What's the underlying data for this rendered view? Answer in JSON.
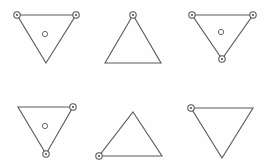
{
  "figure": {
    "width": 267,
    "height": 166,
    "background_color": "#fefefe",
    "line_color": "#585858",
    "marker_stroke_color": "#555555",
    "marker_fill_color": "#fdfdfd",
    "center_marker_stroke_color": "#6a6a6a",
    "grid": {
      "columns": 3,
      "rows": 2,
      "cell_width": 89,
      "cell_height": 83
    }
  },
  "cells": [
    {
      "id": "cell-1",
      "name": "downward-triangle-two-top-vertices-with-center",
      "row": 1,
      "column": 1,
      "orientation": "down",
      "points": "17,15 76,15 46,63",
      "vertices": [
        {
          "name": "top-left",
          "x": 17,
          "y": 15,
          "marker": true
        },
        {
          "name": "top-right",
          "x": 76,
          "y": 15,
          "marker": true
        },
        {
          "name": "bottom",
          "x": 46,
          "y": 63,
          "marker": false
        }
      ],
      "center_marker": {
        "present": true,
        "x": 45,
        "y": 34,
        "r": 2.6
      },
      "marker_count": 2
    },
    {
      "id": "cell-2",
      "name": "upward-triangle-apex-vertex",
      "row": 1,
      "column": 2,
      "orientation": "up",
      "points": "133,15 161,63 105,63",
      "vertices": [
        {
          "name": "apex",
          "x": 133,
          "y": 15,
          "marker": true
        },
        {
          "name": "bottom-right",
          "x": 161,
          "y": 63,
          "marker": false
        },
        {
          "name": "bottom-left",
          "x": 105,
          "y": 63,
          "marker": false
        }
      ],
      "center_marker": {
        "present": false,
        "x": 133,
        "y": 47,
        "r": 2.6
      },
      "marker_count": 1
    },
    {
      "id": "cell-3",
      "name": "downward-triangle-all-vertices-with-center",
      "row": 1,
      "column": 3,
      "orientation": "down",
      "points": "192,15 253,15 222,59",
      "vertices": [
        {
          "name": "top-left",
          "x": 192,
          "y": 15,
          "marker": true
        },
        {
          "name": "top-right",
          "x": 253,
          "y": 15,
          "marker": true
        },
        {
          "name": "bottom",
          "x": 222,
          "y": 59,
          "marker": true
        }
      ],
      "center_marker": {
        "present": true,
        "x": 221,
        "y": 32,
        "r": 2.6
      },
      "marker_count": 3
    },
    {
      "id": "cell-4",
      "name": "downward-triangle-right-and-bottom-vertices-with-center",
      "row": 2,
      "column": 1,
      "orientation": "down",
      "points": "18,107 73,107 46,154",
      "vertices": [
        {
          "name": "top-left",
          "x": 18,
          "y": 107,
          "marker": false
        },
        {
          "name": "top-right",
          "x": 73,
          "y": 107,
          "marker": true
        },
        {
          "name": "bottom",
          "x": 46,
          "y": 154,
          "marker": true
        }
      ],
      "center_marker": {
        "present": true,
        "x": 45,
        "y": 126,
        "r": 2.6
      },
      "marker_count": 2
    },
    {
      "id": "cell-5",
      "name": "upward-triangle-bottom-left-vertex",
      "row": 2,
      "column": 2,
      "orientation": "up",
      "points": "133,112 162,156 99,156",
      "vertices": [
        {
          "name": "apex",
          "x": 133,
          "y": 112,
          "marker": false
        },
        {
          "name": "bottom-right",
          "x": 162,
          "y": 156,
          "marker": false
        },
        {
          "name": "bottom-left",
          "x": 99,
          "y": 156,
          "marker": true
        }
      ],
      "center_marker": {
        "present": false,
        "x": 131,
        "y": 142,
        "r": 2.6
      },
      "marker_count": 1
    },
    {
      "id": "cell-6",
      "name": "downward-triangle-top-left-vertex",
      "row": 2,
      "column": 3,
      "orientation": "down",
      "points": "191,108 253,108 222,158",
      "vertices": [
        {
          "name": "top-left",
          "x": 191,
          "y": 108,
          "marker": true
        },
        {
          "name": "top-right",
          "x": 253,
          "y": 108,
          "marker": false
        },
        {
          "name": "bottom",
          "x": 222,
          "y": 158,
          "marker": false
        }
      ],
      "center_marker": {
        "present": false,
        "x": 222,
        "y": 126,
        "r": 2.6
      },
      "marker_count": 1
    }
  ],
  "marker_style": {
    "vertex_radius": 3.2,
    "vertex_inner_radius": 1.1,
    "center_radius": 2.6
  }
}
